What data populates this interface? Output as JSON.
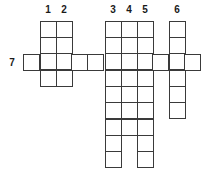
{
  "puzzle": {
    "type": "crossword",
    "cell_size": 16,
    "colors": {
      "line": "#3a3a3a",
      "cell": "#ffffff",
      "number": "#1a1a1a"
    },
    "entries": [
      {
        "number": "1",
        "direction": "down",
        "col_x": 40,
        "top_y": 21,
        "length": 4,
        "label_x": 40,
        "label_y": 5
      },
      {
        "number": "2",
        "direction": "down",
        "col_x": 56,
        "top_y": 21,
        "length": 4,
        "label_x": 56,
        "label_y": 5
      },
      {
        "number": "3",
        "direction": "down",
        "col_x": 105,
        "top_y": 21,
        "length": 9,
        "label_x": 105,
        "label_y": 5
      },
      {
        "number": "4",
        "direction": "down",
        "col_x": 121,
        "top_y": 21,
        "length": 7,
        "label_x": 121,
        "label_y": 5
      },
      {
        "number": "5",
        "direction": "down",
        "col_x": 137,
        "top_y": 21,
        "length": 9,
        "label_x": 137,
        "label_y": 5
      },
      {
        "number": "6",
        "direction": "down",
        "col_x": 169,
        "top_y": 21,
        "length": 6,
        "label_x": 169,
        "label_y": 5
      },
      {
        "number": "7",
        "direction": "across",
        "col_x": 23,
        "top_y": 54,
        "length": 11,
        "label_x": 4,
        "label_y": 58
      }
    ]
  }
}
